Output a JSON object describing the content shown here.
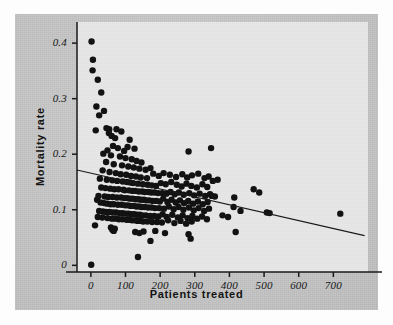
{
  "figure": {
    "name": "mortality-vs-patients-scatter",
    "background_color": "#fdfdfd",
    "panel_color": "#c9c9c9",
    "plot_field_color": "#e6e6e6",
    "marker_color": "#121212",
    "line_color": "#1a1a1a",
    "axis_color": "#1a1a1a"
  },
  "chart_data": {
    "type": "scatter",
    "title": "",
    "xlabel": "Patients treated",
    "ylabel": "Mortality rate",
    "xlim": [
      -40,
      800
    ],
    "ylim": [
      -0.012,
      0.438
    ],
    "xticks": [
      0,
      100,
      200,
      300,
      400,
      500,
      600,
      700
    ],
    "xticklabels": [
      "0",
      "100",
      "200",
      "300",
      "400",
      "500",
      "600",
      "700"
    ],
    "yticks": [
      0,
      0.1,
      0.2,
      0.3,
      0.4
    ],
    "yticklabels": [
      "0",
      "0.1",
      "0.2",
      "0.3",
      "0.4"
    ],
    "grid": false,
    "legend": null,
    "marker_size": 3.2,
    "trendline": {
      "kind": "linear-regression",
      "x": [
        -40,
        790
      ],
      "y": [
        0.1715,
        0.0535
      ],
      "intercept": 0.1658,
      "slope": -0.0001422
    },
    "points": [
      [
        2,
        0.403
      ],
      [
        6,
        0.37
      ],
      [
        5,
        0.351
      ],
      [
        20,
        0.334
      ],
      [
        30,
        0.311
      ],
      [
        16,
        0.286
      ],
      [
        38,
        0.278
      ],
      [
        24,
        0.27
      ],
      [
        14,
        0.243
      ],
      [
        45,
        0.247
      ],
      [
        53,
        0.245
      ],
      [
        60,
        0.233
      ],
      [
        52,
        0.238
      ],
      [
        74,
        0.245
      ],
      [
        88,
        0.241
      ],
      [
        70,
        0.229
      ],
      [
        112,
        0.226
      ],
      [
        64,
        0.215
      ],
      [
        48,
        0.207
      ],
      [
        78,
        0.211
      ],
      [
        96,
        0.206
      ],
      [
        106,
        0.213
      ],
      [
        126,
        0.21
      ],
      [
        282,
        0.205
      ],
      [
        347,
        0.211
      ],
      [
        36,
        0.201
      ],
      [
        58,
        0.198
      ],
      [
        84,
        0.196
      ],
      [
        100,
        0.193
      ],
      [
        118,
        0.191
      ],
      [
        132,
        0.188
      ],
      [
        146,
        0.185
      ],
      [
        44,
        0.186
      ],
      [
        66,
        0.182
      ],
      [
        90,
        0.18
      ],
      [
        108,
        0.178
      ],
      [
        124,
        0.176
      ],
      [
        140,
        0.174
      ],
      [
        158,
        0.172
      ],
      [
        172,
        0.175
      ],
      [
        34,
        0.171
      ],
      [
        54,
        0.168
      ],
      [
        72,
        0.166
      ],
      [
        86,
        0.164
      ],
      [
        102,
        0.163
      ],
      [
        116,
        0.161
      ],
      [
        130,
        0.16
      ],
      [
        144,
        0.158
      ],
      [
        162,
        0.157
      ],
      [
        180,
        0.165
      ],
      [
        196,
        0.161
      ],
      [
        210,
        0.166
      ],
      [
        228,
        0.163
      ],
      [
        246,
        0.159
      ],
      [
        264,
        0.164
      ],
      [
        278,
        0.158
      ],
      [
        292,
        0.162
      ],
      [
        310,
        0.165
      ],
      [
        328,
        0.157
      ],
      [
        340,
        0.16
      ],
      [
        26,
        0.156
      ],
      [
        46,
        0.154
      ],
      [
        62,
        0.153
      ],
      [
        76,
        0.152
      ],
      [
        92,
        0.151
      ],
      [
        104,
        0.15
      ],
      [
        114,
        0.149
      ],
      [
        122,
        0.148
      ],
      [
        136,
        0.147
      ],
      [
        150,
        0.146
      ],
      [
        164,
        0.145
      ],
      [
        176,
        0.144
      ],
      [
        188,
        0.143
      ],
      [
        202,
        0.148
      ],
      [
        216,
        0.146
      ],
      [
        232,
        0.15
      ],
      [
        248,
        0.145
      ],
      [
        262,
        0.142
      ],
      [
        276,
        0.147
      ],
      [
        290,
        0.143
      ],
      [
        306,
        0.14
      ],
      [
        322,
        0.146
      ],
      [
        336,
        0.141
      ],
      [
        352,
        0.152
      ],
      [
        366,
        0.154
      ],
      [
        30,
        0.14
      ],
      [
        42,
        0.139
      ],
      [
        56,
        0.138
      ],
      [
        68,
        0.137
      ],
      [
        80,
        0.137
      ],
      [
        94,
        0.136
      ],
      [
        98,
        0.135
      ],
      [
        110,
        0.135
      ],
      [
        120,
        0.134
      ],
      [
        128,
        0.134
      ],
      [
        138,
        0.133
      ],
      [
        148,
        0.133
      ],
      [
        156,
        0.132
      ],
      [
        166,
        0.132
      ],
      [
        174,
        0.131
      ],
      [
        184,
        0.131
      ],
      [
        194,
        0.13
      ],
      [
        206,
        0.13
      ],
      [
        218,
        0.129
      ],
      [
        230,
        0.132
      ],
      [
        242,
        0.128
      ],
      [
        254,
        0.131
      ],
      [
        268,
        0.127
      ],
      [
        284,
        0.13
      ],
      [
        298,
        0.126
      ],
      [
        314,
        0.129
      ],
      [
        330,
        0.125
      ],
      [
        344,
        0.128
      ],
      [
        358,
        0.124
      ],
      [
        470,
        0.137
      ],
      [
        486,
        0.131
      ],
      [
        414,
        0.122
      ],
      [
        22,
        0.125
      ],
      [
        40,
        0.124
      ],
      [
        50,
        0.123
      ],
      [
        63,
        0.123
      ],
      [
        75,
        0.122
      ],
      [
        87,
        0.122
      ],
      [
        97,
        0.121
      ],
      [
        105,
        0.121
      ],
      [
        113,
        0.12
      ],
      [
        121,
        0.12
      ],
      [
        129,
        0.119
      ],
      [
        137,
        0.119
      ],
      [
        145,
        0.118
      ],
      [
        153,
        0.118
      ],
      [
        161,
        0.117
      ],
      [
        169,
        0.117
      ],
      [
        179,
        0.116
      ],
      [
        189,
        0.116
      ],
      [
        199,
        0.115
      ],
      [
        209,
        0.12
      ],
      [
        221,
        0.114
      ],
      [
        233,
        0.118
      ],
      [
        245,
        0.113
      ],
      [
        257,
        0.117
      ],
      [
        269,
        0.112
      ],
      [
        281,
        0.116
      ],
      [
        295,
        0.111
      ],
      [
        309,
        0.115
      ],
      [
        323,
        0.11
      ],
      [
        337,
        0.114
      ],
      [
        349,
        0.125
      ],
      [
        18,
        0.118
      ],
      [
        28,
        0.113
      ],
      [
        38,
        0.112
      ],
      [
        47,
        0.111
      ],
      [
        57,
        0.11
      ],
      [
        66,
        0.11
      ],
      [
        78,
        0.109
      ],
      [
        89,
        0.109
      ],
      [
        99,
        0.108
      ],
      [
        107,
        0.108
      ],
      [
        115,
        0.107
      ],
      [
        123,
        0.107
      ],
      [
        131,
        0.106
      ],
      [
        139,
        0.106
      ],
      [
        147,
        0.105
      ],
      [
        155,
        0.105
      ],
      [
        165,
        0.104
      ],
      [
        175,
        0.104
      ],
      [
        185,
        0.103
      ],
      [
        197,
        0.103
      ],
      [
        211,
        0.102
      ],
      [
        225,
        0.106
      ],
      [
        239,
        0.101
      ],
      [
        253,
        0.105
      ],
      [
        267,
        0.1
      ],
      [
        283,
        0.104
      ],
      [
        297,
        0.099
      ],
      [
        311,
        0.103
      ],
      [
        327,
        0.098
      ],
      [
        341,
        0.102
      ],
      [
        412,
        0.105
      ],
      [
        432,
        0.098
      ],
      [
        508,
        0.095
      ],
      [
        516,
        0.094
      ],
      [
        720,
        0.093
      ],
      [
        24,
        0.098
      ],
      [
        35,
        0.097
      ],
      [
        44,
        0.096
      ],
      [
        54,
        0.096
      ],
      [
        64,
        0.095
      ],
      [
        73,
        0.095
      ],
      [
        83,
        0.094
      ],
      [
        92,
        0.094
      ],
      [
        101,
        0.093
      ],
      [
        109,
        0.093
      ],
      [
        117,
        0.092
      ],
      [
        125,
        0.092
      ],
      [
        133,
        0.091
      ],
      [
        141,
        0.091
      ],
      [
        149,
        0.09
      ],
      [
        159,
        0.09
      ],
      [
        171,
        0.089
      ],
      [
        183,
        0.089
      ],
      [
        195,
        0.088
      ],
      [
        207,
        0.092
      ],
      [
        219,
        0.087
      ],
      [
        235,
        0.091
      ],
      [
        251,
        0.086
      ],
      [
        265,
        0.09
      ],
      [
        279,
        0.085
      ],
      [
        293,
        0.089
      ],
      [
        307,
        0.084
      ],
      [
        321,
        0.088
      ],
      [
        335,
        0.083
      ],
      [
        380,
        0.09
      ],
      [
        396,
        0.087
      ],
      [
        20,
        0.087
      ],
      [
        33,
        0.086
      ],
      [
        48,
        0.085
      ],
      [
        61,
        0.084
      ],
      [
        71,
        0.084
      ],
      [
        81,
        0.083
      ],
      [
        91,
        0.083
      ],
      [
        103,
        0.082
      ],
      [
        111,
        0.082
      ],
      [
        119,
        0.081
      ],
      [
        127,
        0.081
      ],
      [
        135,
        0.08
      ],
      [
        143,
        0.08
      ],
      [
        151,
        0.079
      ],
      [
        163,
        0.079
      ],
      [
        177,
        0.078
      ],
      [
        191,
        0.078
      ],
      [
        205,
        0.077
      ],
      [
        223,
        0.081
      ],
      [
        241,
        0.076
      ],
      [
        259,
        0.08
      ],
      [
        275,
        0.075
      ],
      [
        291,
        0.079
      ],
      [
        12,
        0.072
      ],
      [
        58,
        0.068
      ],
      [
        62,
        0.064
      ],
      [
        66,
        0.062
      ],
      [
        69,
        0.066
      ],
      [
        128,
        0.06
      ],
      [
        140,
        0.058
      ],
      [
        152,
        0.061
      ],
      [
        186,
        0.062
      ],
      [
        214,
        0.058
      ],
      [
        282,
        0.056
      ],
      [
        288,
        0.048
      ],
      [
        418,
        0.06
      ],
      [
        172,
        0.044
      ],
      [
        136,
        0.015
      ],
      [
        1,
        0.001
      ]
    ]
  }
}
